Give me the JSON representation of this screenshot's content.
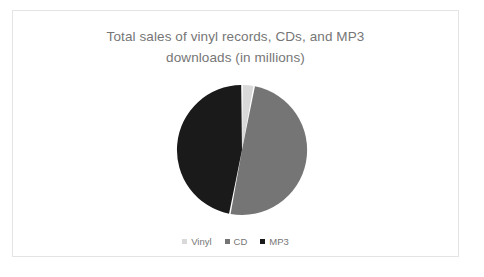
{
  "chart_data": {
    "type": "pie",
    "title": "Total sales of vinyl records, CDs, and MP3\ndownloads (in millions)",
    "title_line_1": "Total sales of vinyl records, CDs, and MP3",
    "title_line_2": "downloads (in millions)",
    "xlabel": "",
    "ylabel": "",
    "grid": false,
    "legend_position": "bottom",
    "categories": [
      "Vinyl",
      "CD",
      "MP3"
    ],
    "values": [
      3,
      50,
      47
    ],
    "unit": "millions",
    "slices": [
      {
        "label": "Vinyl",
        "value": 3,
        "percent": 3,
        "color": "#d9d9d9",
        "start_angle_deg": 0,
        "end_angle_deg": 10.8
      },
      {
        "label": "CD",
        "value": 50,
        "percent": 50,
        "color": "#757575",
        "start_angle_deg": 10.8,
        "end_angle_deg": 190.8
      },
      {
        "label": "MP3",
        "value": 47,
        "percent": 47,
        "color": "#1a1a1a",
        "start_angle_deg": 190.8,
        "end_angle_deg": 360
      }
    ],
    "geometry": {
      "center_x": 66,
      "center_y": 66,
      "radius": 65,
      "gap_deg": 1.4
    },
    "colors": {
      "vinyl": "#d9d9d9",
      "cd": "#757575",
      "mp3": "#1a1a1a",
      "title_text": "#767676",
      "legend_text": "#767676",
      "card_border": "#e4e4e4",
      "background": "#ffffff"
    }
  },
  "legend": {
    "items": [
      {
        "label": "Vinyl",
        "color": "#d9d9d9",
        "marker": "square-swatch-icon"
      },
      {
        "label": "CD",
        "color": "#757575",
        "marker": "square-swatch-icon"
      },
      {
        "label": "MP3",
        "color": "#1a1a1a",
        "marker": "square-swatch-icon"
      }
    ]
  }
}
